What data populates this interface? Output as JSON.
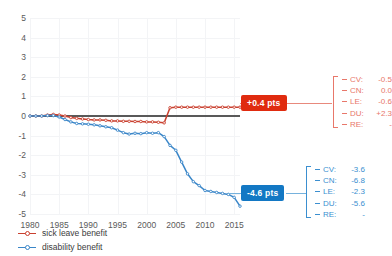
{
  "title": "",
  "chart_data": {
    "type": "line",
    "title": "",
    "subtitle": "",
    "xlabel": "",
    "ylabel": "",
    "xlim": [
      1980,
      2016
    ],
    "ylim": [
      -5,
      5
    ],
    "yticks": [
      "5",
      "4",
      "3",
      "2",
      "1",
      "0",
      "-1",
      "-2",
      "-3",
      "-4",
      "-5"
    ],
    "xticks": [
      "1980",
      "1985",
      "1990",
      "1995",
      "2000",
      "2005",
      "2010",
      "2015"
    ],
    "grid": true,
    "legend_position": "bottom-left",
    "zero_reference_line": true,
    "series": [
      {
        "name": "sick leave benefit",
        "color": "#c9402f",
        "x": [
          1980,
          1981,
          1982,
          1983,
          1984,
          1985,
          1986,
          1987,
          1988,
          1989,
          1990,
          1991,
          1992,
          1993,
          1994,
          1995,
          1996,
          1997,
          1998,
          1999,
          2000,
          2001,
          2002,
          2003,
          2004,
          2005,
          2006,
          2007,
          2008,
          2009,
          2010,
          2011,
          2012,
          2013,
          2014,
          2015,
          2016
        ],
        "values": [
          0.0,
          0.0,
          0.0,
          0.05,
          0.08,
          0.05,
          0.0,
          -0.08,
          -0.12,
          -0.15,
          -0.18,
          -0.2,
          -0.2,
          -0.22,
          -0.25,
          -0.25,
          -0.27,
          -0.27,
          -0.28,
          -0.28,
          -0.3,
          -0.3,
          -0.32,
          -0.35,
          0.42,
          0.45,
          0.45,
          0.45,
          0.45,
          0.45,
          0.45,
          0.45,
          0.45,
          0.45,
          0.45,
          0.45,
          0.45
        ]
      },
      {
        "name": "disability benefit",
        "color": "#3a86c8",
        "x": [
          1980,
          1981,
          1982,
          1983,
          1984,
          1985,
          1986,
          1987,
          1988,
          1989,
          1990,
          1991,
          1992,
          1993,
          1994,
          1995,
          1996,
          1997,
          1998,
          1999,
          2000,
          2001,
          2002,
          2003,
          2004,
          2005,
          2006,
          2007,
          2008,
          2009,
          2010,
          2011,
          2012,
          2013,
          2014,
          2015,
          2016
        ],
        "values": [
          0.0,
          0.0,
          0.0,
          0.02,
          0.02,
          -0.05,
          -0.18,
          -0.3,
          -0.38,
          -0.4,
          -0.42,
          -0.45,
          -0.5,
          -0.55,
          -0.6,
          -0.72,
          -0.85,
          -0.92,
          -0.88,
          -0.9,
          -0.85,
          -0.88,
          -0.85,
          -1.05,
          -1.5,
          -1.75,
          -2.35,
          -2.95,
          -3.35,
          -3.55,
          -3.8,
          -3.85,
          -3.9,
          -3.95,
          -4.0,
          -4.15,
          -4.6
        ]
      }
    ]
  },
  "annotations": {
    "badge_top": {
      "label": "+0.4 pts",
      "color": "#e02b0f"
    },
    "badge_bottom": {
      "label": "-4.6 pts",
      "color": "#1378c4"
    },
    "table_top": {
      "color": "#e8776a",
      "rows": [
        {
          "key": "CV:",
          "value": "-0.5"
        },
        {
          "key": "CN:",
          "value": "0.0"
        },
        {
          "key": "LE:",
          "value": "-0.6"
        },
        {
          "key": "DU:",
          "value": "+2.3"
        },
        {
          "key": "RE:",
          "value": "-"
        }
      ]
    },
    "table_bottom": {
      "color": "#3b8fd0",
      "rows": [
        {
          "key": "CV:",
          "value": "-3.6"
        },
        {
          "key": "CN:",
          "value": "-6.8"
        },
        {
          "key": "LE:",
          "value": "-2.3"
        },
        {
          "key": "DU:",
          "value": "-5.6"
        },
        {
          "key": "RE:",
          "value": "-"
        }
      ]
    }
  },
  "legend": {
    "items": [
      {
        "label": "sick leave benefit",
        "color": "#c9402f"
      },
      {
        "label": "disability benefit",
        "color": "#3a86c8"
      }
    ]
  }
}
